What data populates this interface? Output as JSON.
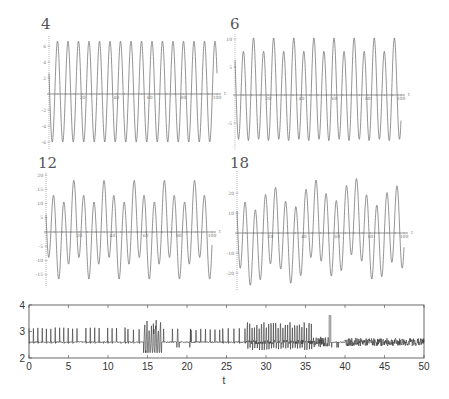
{
  "chart_data": [
    {
      "type": "line",
      "panel_label": "4",
      "xlabel": "t",
      "ylabel": "",
      "xlim": [
        0,
        100
      ],
      "ylim": [
        -6.5,
        7
      ],
      "xticks": [
        20,
        40,
        60,
        80,
        100
      ],
      "yticks": [
        6,
        4,
        2,
        -2,
        -4,
        -6
      ],
      "signal": {
        "components": [
          {
            "amp": 6.3,
            "freq": 0.16,
            "phase": 1.2
          }
        ],
        "offset": 0.3
      },
      "grid": false
    },
    {
      "type": "line",
      "panel_label": "6",
      "xlabel": "t",
      "ylabel": "",
      "xlim": [
        0,
        100
      ],
      "ylim": [
        -9,
        10.5
      ],
      "xticks": [
        20,
        40,
        60,
        80,
        100
      ],
      "yticks": [
        10,
        5,
        -5
      ],
      "signal": {
        "components": [
          {
            "amp": 8.5,
            "freq": 0.165,
            "phase": 1.0
          },
          {
            "amp": 1.2,
            "freq": 0.0825,
            "phase": 0.4
          }
        ],
        "offset": 0.5
      },
      "grid": false
    },
    {
      "type": "line",
      "panel_label": "12",
      "xlabel": "t",
      "ylabel": "",
      "xlim": [
        0,
        100
      ],
      "ylim": [
        -18,
        20
      ],
      "xticks": [
        20,
        40,
        60,
        80,
        100
      ],
      "yticks": [
        20,
        15,
        10,
        5,
        -5,
        -10,
        -15
      ],
      "signal": {
        "components": [
          {
            "amp": 13,
            "freq": 0.165,
            "phase": 1.5
          },
          {
            "amp": 4.5,
            "freq": 0.055,
            "phase": 0.2
          }
        ],
        "offset": 0.8
      },
      "grid": false
    },
    {
      "type": "line",
      "panel_label": "18",
      "xlabel": "t",
      "ylabel": "",
      "xlim": [
        0,
        100
      ],
      "ylim": [
        -27,
        30
      ],
      "xticks": [
        20,
        40,
        60,
        80,
        100
      ],
      "yticks": [
        20,
        10,
        -10,
        -20
      ],
      "signal": {
        "components": [
          {
            "amp": 19,
            "freq": 0.165,
            "phase": 1.2
          },
          {
            "amp": 6,
            "freq": 0.041,
            "phase": 0.7
          },
          {
            "amp": 2.5,
            "freq": 0.011,
            "phase": 2.0
          }
        ],
        "offset": 0.5
      },
      "grid": false
    },
    {
      "type": "line",
      "panel_label": "",
      "xlabel": "t",
      "ylabel": "",
      "xlim": [
        0,
        50
      ],
      "ylim": [
        2,
        4
      ],
      "xticks": [
        0,
        5,
        10,
        15,
        20,
        25,
        30,
        35,
        40,
        45,
        50
      ],
      "yticks": [
        2,
        3,
        4
      ],
      "baseline": 2.6,
      "segments": [
        {
          "from": 0,
          "to": 6.2,
          "style": "spikes",
          "period": 0.55,
          "peak": 3.15
        },
        {
          "from": 6.2,
          "to": 7.2,
          "style": "quiet"
        },
        {
          "from": 7.2,
          "to": 12.5,
          "style": "spikes",
          "period": 0.55,
          "peak": 3.15
        },
        {
          "from": 12.5,
          "to": 14.5,
          "style": "spikes",
          "period": 0.7,
          "peak": 3.1
        },
        {
          "from": 14.5,
          "to": 16.8,
          "style": "burst",
          "peak": 3.5,
          "trough": 2.2
        },
        {
          "from": 16.8,
          "to": 20.5,
          "style": "sparse",
          "peak": 3.1
        },
        {
          "from": 20.5,
          "to": 24.5,
          "style": "spikes",
          "period": 0.6,
          "peak": 3.1
        },
        {
          "from": 24.5,
          "to": 27.5,
          "style": "spikes",
          "period": 0.7,
          "peak": 3.15
        },
        {
          "from": 27.5,
          "to": 36,
          "style": "dense",
          "peak": 3.3,
          "trough": 2.3
        },
        {
          "from": 36,
          "to": 38,
          "style": "noisy",
          "peak": 2.8,
          "trough": 2.4
        },
        {
          "from": 38,
          "to": 38.2,
          "style": "spike",
          "peak": 3.6
        },
        {
          "from": 38.2,
          "to": 40,
          "style": "sparse",
          "peak": 3.0
        },
        {
          "from": 40,
          "to": 50,
          "style": "noisy",
          "peak": 2.75,
          "trough": 2.45
        }
      ],
      "grid": false
    }
  ]
}
